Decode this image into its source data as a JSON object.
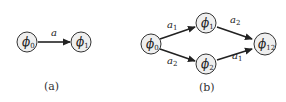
{
  "figure_a": {
    "caption": "(a)",
    "nodes": [
      {
        "id": "phi0",
        "symbol": "ϕ",
        "sub": "0"
      },
      {
        "id": "phi1",
        "symbol": "ϕ",
        "sub": "1"
      }
    ],
    "edges": [
      {
        "from": "phi0",
        "to": "phi1",
        "label": "a",
        "label_sub": ""
      }
    ]
  },
  "figure_b": {
    "caption": "(b)",
    "nodes": [
      {
        "id": "phi0",
        "symbol": "ϕ",
        "sub": "0"
      },
      {
        "id": "phi1",
        "symbol": "ϕ",
        "sub": "1"
      },
      {
        "id": "phi2",
        "symbol": "ϕ",
        "sub": "2"
      },
      {
        "id": "phi12",
        "symbol": "ϕ",
        "sub": "12"
      }
    ],
    "edges": [
      {
        "from": "phi0",
        "to": "phi1",
        "label": "a",
        "label_sub": "1"
      },
      {
        "from": "phi0",
        "to": "phi2",
        "label": "a",
        "label_sub": "2"
      },
      {
        "from": "phi1",
        "to": "phi12",
        "label": "a",
        "label_sub": "2"
      },
      {
        "from": "phi2",
        "to": "phi12",
        "label": "a",
        "label_sub": "1"
      }
    ]
  }
}
